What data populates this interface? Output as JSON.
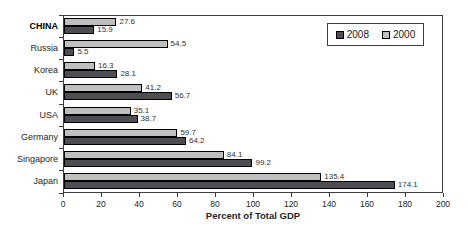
{
  "chart_data": {
    "type": "bar",
    "orientation": "horizontal",
    "xlabel": "Percent of Total GDP",
    "xlim": [
      0,
      200
    ],
    "xticks": [
      0,
      20,
      40,
      60,
      80,
      100,
      120,
      140,
      160,
      180,
      200
    ],
    "categories": [
      "CHINA",
      "Russia",
      "Korea",
      "UK",
      "USA",
      "Germany",
      "Singapore",
      "Japan"
    ],
    "bold_categories": [
      "CHINA"
    ],
    "series": [
      {
        "name": "2008",
        "color": "#4d4d52",
        "border_color": "#000000",
        "values": [
          15.9,
          5.5,
          28.1,
          56.7,
          38.7,
          64.2,
          99.2,
          174.1
        ]
      },
      {
        "name": "2000",
        "color": "#bfbfbf",
        "border_color": "#000000",
        "values": [
          27.6,
          54.5,
          16.3,
          41.2,
          35.1,
          59.7,
          84.1,
          135.4
        ]
      }
    ],
    "group_order_top_to_bottom": [
      "2000",
      "2008"
    ],
    "legend": {
      "position": "top-right",
      "entries": [
        "2008",
        "2000"
      ]
    },
    "grid": false,
    "value_labels": true
  }
}
